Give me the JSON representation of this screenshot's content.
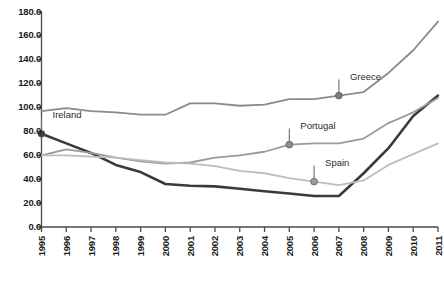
{
  "chart_data": {
    "type": "line",
    "title": "",
    "subtitle": "",
    "xlabel": "",
    "ylabel": "",
    "xlim": [
      1995,
      2011
    ],
    "ylim": [
      0,
      180
    ],
    "grid": false,
    "legend_position": "inline-annotations",
    "x": [
      1995,
      1996,
      1997,
      1998,
      1999,
      2000,
      2001,
      2002,
      2003,
      2004,
      2005,
      2006,
      2007,
      2008,
      2009,
      2010,
      2011
    ],
    "y_ticks": [
      "0.0",
      "20.0",
      "40.0",
      "60.0",
      "80.0",
      "100.0",
      "120.0",
      "140.0",
      "160.0",
      "180.0"
    ],
    "y_tick_values": [
      0,
      20,
      40,
      60,
      80,
      100,
      120,
      140,
      160,
      180
    ],
    "x_tick_labels": [
      "1995",
      "1996",
      "1997",
      "1998",
      "1999",
      "2000",
      "2001",
      "2002",
      "2003",
      "2004",
      "2005",
      "2006",
      "2007",
      "2008",
      "2009",
      "2010",
      "2011"
    ],
    "series": [
      {
        "name": "Greece",
        "color": "#8a8a8a",
        "width": 1.8,
        "values": [
          97,
          99.5,
          97,
          96,
          94,
          94,
          103.5,
          103.5,
          101.5,
          102.5,
          107,
          107,
          110,
          113,
          129,
          148,
          172
        ]
      },
      {
        "name": "Ireland",
        "color": "#3a3a3a",
        "width": 2.6,
        "values": [
          78,
          70,
          62,
          52,
          46,
          36,
          34.5,
          34,
          32,
          30,
          28,
          26,
          26,
          45,
          66,
          93,
          110
        ]
      },
      {
        "name": "Portugal",
        "color": "#9a9a9a",
        "width": 1.8,
        "values": [
          60,
          65,
          62,
          58,
          55,
          53,
          54,
          58,
          60,
          63,
          69,
          70,
          70,
          74,
          87,
          96,
          108
        ]
      },
      {
        "name": "Spain",
        "color": "#bdbdbd",
        "width": 1.8,
        "values": [
          60,
          60,
          59,
          58,
          56,
          54,
          53,
          51,
          47,
          45,
          41,
          38,
          35,
          39,
          52,
          61,
          70
        ]
      }
    ],
    "annotations": [
      {
        "label": "Ireland",
        "series": "Ireland",
        "x": 1995,
        "y": 78,
        "marker": true,
        "marker_color": "#3a3a3a",
        "label_dx": 9,
        "label_dy": -19
      },
      {
        "label": "Greece",
        "series": "Greece",
        "x": 2007,
        "y": 110,
        "marker": true,
        "marker_color": "#7d7d7d",
        "label_dx": 9,
        "label_dy": -19
      },
      {
        "label": "Portugal",
        "series": "Portugal",
        "x": 2005,
        "y": 69,
        "marker": true,
        "marker_color": "#8d8d8d",
        "label_dx": 9,
        "label_dy": -19
      },
      {
        "label": "Spain",
        "series": "Spain",
        "x": 2006,
        "y": 38,
        "marker": true,
        "marker_color": "#9d9d9d",
        "label_dx": 9,
        "label_dy": -19
      }
    ],
    "axis_color": "#4a4a4a"
  }
}
